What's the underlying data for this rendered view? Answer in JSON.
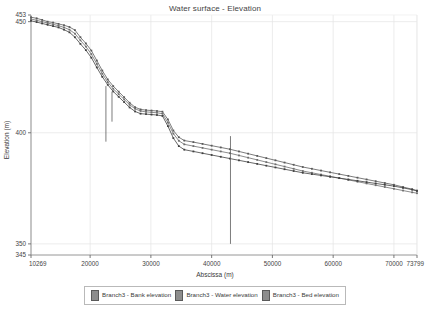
{
  "chart_data": {
    "type": "line",
    "title": "Water surface - Elevation",
    "xlabel": "Abscissa (m)",
    "ylabel": "Elevation (m)",
    "xlim": [
      10269,
      73799
    ],
    "ylim": [
      345,
      453
    ],
    "grid": true,
    "legend_position": "bottom",
    "xticks": [
      10269,
      20000,
      30000,
      40000,
      50000,
      60000,
      70000,
      73799
    ],
    "xtick_labels": [
      "10269",
      "20000",
      "30000",
      "40000",
      "50000",
      "60000",
      "70000",
      "73799"
    ],
    "yticks": [
      345,
      350,
      400,
      450,
      453
    ],
    "ytick_labels": [
      "345",
      "350",
      "400",
      "450",
      "453"
    ],
    "series": [
      {
        "name": "Branch3 - Bank elevation",
        "color": "#5a5a5a",
        "x": [
          10269,
          11200,
          12100,
          13000,
          13900,
          14800,
          15700,
          16600,
          17500,
          18400,
          19300,
          20200,
          21100,
          22000,
          22900,
          23800,
          24700,
          25600,
          26500,
          27400,
          28300,
          29200,
          30100,
          31000,
          31900,
          32800,
          33700,
          34600,
          35500,
          37000,
          38500,
          40000,
          41500,
          43000,
          44500,
          46000,
          47500,
          49000,
          50500,
          52000,
          53500,
          55000,
          56500,
          58000,
          59500,
          61000,
          62500,
          64000,
          65500,
          67000,
          68500,
          70000,
          71500,
          73000,
          73799
        ],
        "y": [
          452.0,
          451.5,
          450.8,
          450.0,
          449.6,
          449.0,
          448.4,
          447.6,
          446.2,
          443.0,
          440.2,
          437.0,
          432.5,
          428.0,
          424.0,
          421.0,
          418.5,
          416.0,
          413.5,
          411.5,
          410.5,
          410.2,
          410.0,
          409.8,
          409.5,
          406.0,
          401.0,
          398.0,
          396.5,
          395.8,
          395.0,
          394.2,
          393.4,
          392.6,
          391.6,
          390.6,
          389.6,
          388.6,
          387.6,
          386.6,
          385.6,
          384.6,
          383.8,
          383.0,
          382.2,
          381.4,
          380.6,
          379.8,
          379.0,
          378.2,
          377.4,
          376.6,
          375.6,
          374.6,
          374.0
        ]
      },
      {
        "name": "Branch3 - Water elevation",
        "color": "#6e6e6e",
        "x": [
          10269,
          11200,
          12100,
          13000,
          13900,
          14800,
          15700,
          16600,
          17500,
          18400,
          19300,
          20200,
          21100,
          22000,
          22900,
          23800,
          24700,
          25600,
          26500,
          27400,
          28300,
          29200,
          30100,
          31000,
          31900,
          32800,
          33700,
          34600,
          35500,
          37000,
          38500,
          40000,
          41500,
          43000,
          44500,
          46000,
          47500,
          49000,
          50500,
          52000,
          53500,
          55000,
          56500,
          58000,
          59500,
          61000,
          62500,
          64000,
          65500,
          67000,
          68500,
          70000,
          71500,
          73000,
          73799
        ],
        "y": [
          451.2,
          450.6,
          450.0,
          449.4,
          448.8,
          448.2,
          447.4,
          446.4,
          444.6,
          441.6,
          438.8,
          435.4,
          431.0,
          426.6,
          422.8,
          419.8,
          417.4,
          415.0,
          412.6,
          410.8,
          409.8,
          409.4,
          409.2,
          409.0,
          408.6,
          404.6,
          399.6,
          396.4,
          394.8,
          394.0,
          393.2,
          392.4,
          391.6,
          390.8,
          389.8,
          388.8,
          387.8,
          386.8,
          385.8,
          384.8,
          383.8,
          382.8,
          382.0,
          381.2,
          380.4,
          379.6,
          378.8,
          378.0,
          377.2,
          376.4,
          375.6,
          374.8,
          374.0,
          373.2,
          372.8
        ]
      },
      {
        "name": "Branch3 - Bed elevation",
        "color": "#404040",
        "x": [
          10269,
          11200,
          12100,
          13000,
          13900,
          14800,
          15700,
          16600,
          17500,
          18400,
          19300,
          20200,
          21100,
          22000,
          22900,
          23800,
          24700,
          25600,
          26500,
          27400,
          28300,
          29200,
          30100,
          31000,
          31900,
          32800,
          33700,
          34600,
          35500,
          37000,
          38500,
          40000,
          41500,
          43000,
          44500,
          46000,
          47500,
          49000,
          50500,
          52000,
          53500,
          55000,
          56500,
          58000,
          59500,
          61000,
          62500,
          64000,
          65500,
          67000,
          68500,
          70000,
          71500,
          73000,
          73799
        ],
        "y": [
          450.4,
          449.8,
          449.2,
          448.6,
          448.0,
          447.4,
          446.4,
          445.2,
          443.0,
          440.0,
          437.2,
          433.8,
          429.4,
          425.2,
          421.6,
          418.6,
          416.2,
          413.8,
          411.4,
          409.6,
          408.6,
          408.4,
          408.2,
          408.0,
          407.6,
          403.0,
          397.6,
          394.0,
          392.4,
          391.6,
          390.8,
          390.0,
          389.2,
          388.4,
          387.6,
          386.8,
          386.0,
          385.2,
          384.4,
          383.6,
          382.8,
          382.0,
          381.4,
          380.8,
          380.2,
          379.6,
          379.0,
          378.4,
          377.8,
          377.2,
          376.6,
          376.0,
          375.2,
          374.4,
          373.8
        ]
      }
    ],
    "vertical_markers": [
      {
        "x": 22600,
        "y_top": 421.0,
        "y_bottom": 396.0
      },
      {
        "x": 23600,
        "y_top": 418.5,
        "y_bottom": 405.0
      },
      {
        "x": 43100,
        "y_top": 398.5,
        "y_bottom": 350.0
      }
    ]
  },
  "legend": {
    "items": [
      {
        "label": "Branch3 - Bank elevation"
      },
      {
        "label": "Branch3 - Water elevation"
      },
      {
        "label": "Branch3 - Bed elevation"
      }
    ]
  }
}
